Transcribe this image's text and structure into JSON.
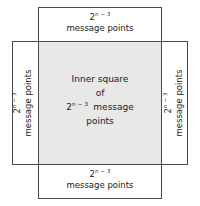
{
  "figure": {
    "colors": {
      "stroke": "#4a4a4a",
      "inner_fill": "#e8e8e8",
      "text": "#1a1a1a",
      "background": "#ffffff"
    },
    "expression": {
      "base": "2",
      "exponent": "n − 3",
      "exponent_n": "n",
      "exponent_rest": "− 3",
      "plain": "2^(n-3)"
    },
    "labels": {
      "units": "message points",
      "top": {
        "power_base": "2",
        "power_exponent": "n − 3",
        "units": "message points"
      },
      "bottom": {
        "power_base": "2",
        "power_exponent": "n − 3",
        "units": "message points"
      },
      "left": {
        "power_base": "2",
        "power_exponent": "n − 3",
        "units": "message points"
      },
      "right": {
        "power_base": "2",
        "power_exponent": "n − 3",
        "units": "message points"
      },
      "center": {
        "line1": "Inner square",
        "line2": "of",
        "power_base": "2",
        "power_exponent": "n − 3",
        "line3_units": "message",
        "line4": "points"
      }
    }
  }
}
